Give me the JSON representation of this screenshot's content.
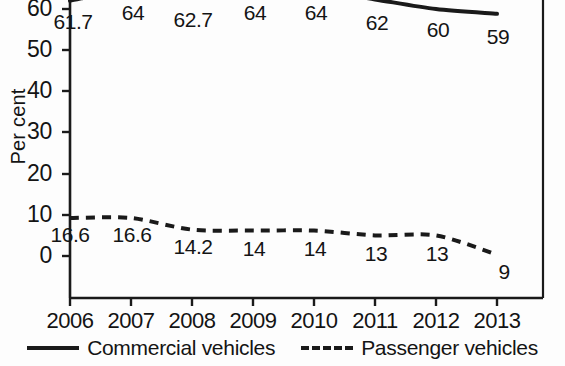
{
  "chart_data": {
    "type": "line",
    "title": "",
    "subtitle": "",
    "xlabel": "",
    "ylabel": "Per cent",
    "categories": [
      "2006",
      "2007",
      "2008",
      "2009",
      "2010",
      "2011",
      "2012",
      "2013"
    ],
    "x": [
      2006,
      2007,
      2008,
      2009,
      2010,
      2011,
      2012,
      2013
    ],
    "ylim": [
      0,
      70
    ],
    "yticks": [
      0,
      10,
      20,
      30,
      40,
      50,
      60
    ],
    "ytick_labels": [
      "0",
      "10",
      "20",
      "30",
      "40",
      "50",
      "60"
    ],
    "grid": false,
    "legend_position": "bottom",
    "note": "Top of plot area is cropped; the commercial vehicles line rises above the visible image edge.",
    "series": [
      {
        "name": "Commercial vehicles",
        "style": "solid",
        "color": "#1a1a1a",
        "values": [
          61.7,
          64,
          62.7,
          64,
          64,
          62,
          60,
          59
        ],
        "labels": [
          "61.7",
          "64",
          "62.7",
          "64",
          "64",
          "62",
          "60",
          "59"
        ]
      },
      {
        "name": "Passenger vehicles",
        "style": "dashed",
        "color": "#1a1a1a",
        "values": [
          16.6,
          16.6,
          14.2,
          14,
          14,
          13,
          13,
          9
        ],
        "labels": [
          "16.6",
          "16.6",
          "14.2",
          "14",
          "14",
          "13",
          "13",
          "9"
        ]
      }
    ]
  },
  "axis": {
    "y_label": "Per cent",
    "y_ticks": [
      "60",
      "50",
      "40",
      "30",
      "20",
      "10",
      "0"
    ],
    "x_ticks": [
      "2006",
      "2007",
      "2008",
      "2009",
      "2010",
      "2011",
      "2012",
      "2013"
    ]
  },
  "legend": {
    "items": [
      {
        "label": "Commercial vehicles",
        "style": "solid"
      },
      {
        "label": "Passenger vehicles",
        "style": "dashed"
      }
    ]
  },
  "labels": {
    "commercial": [
      "61.7",
      "64",
      "62.7",
      "64",
      "64",
      "62",
      "60",
      "59"
    ],
    "passenger": [
      "16.6",
      "16.6",
      "14.2",
      "14",
      "14",
      "13",
      "13",
      "9"
    ]
  },
  "colors": {
    "ink": "#1a1a1a",
    "background": "#fdfdfd"
  }
}
